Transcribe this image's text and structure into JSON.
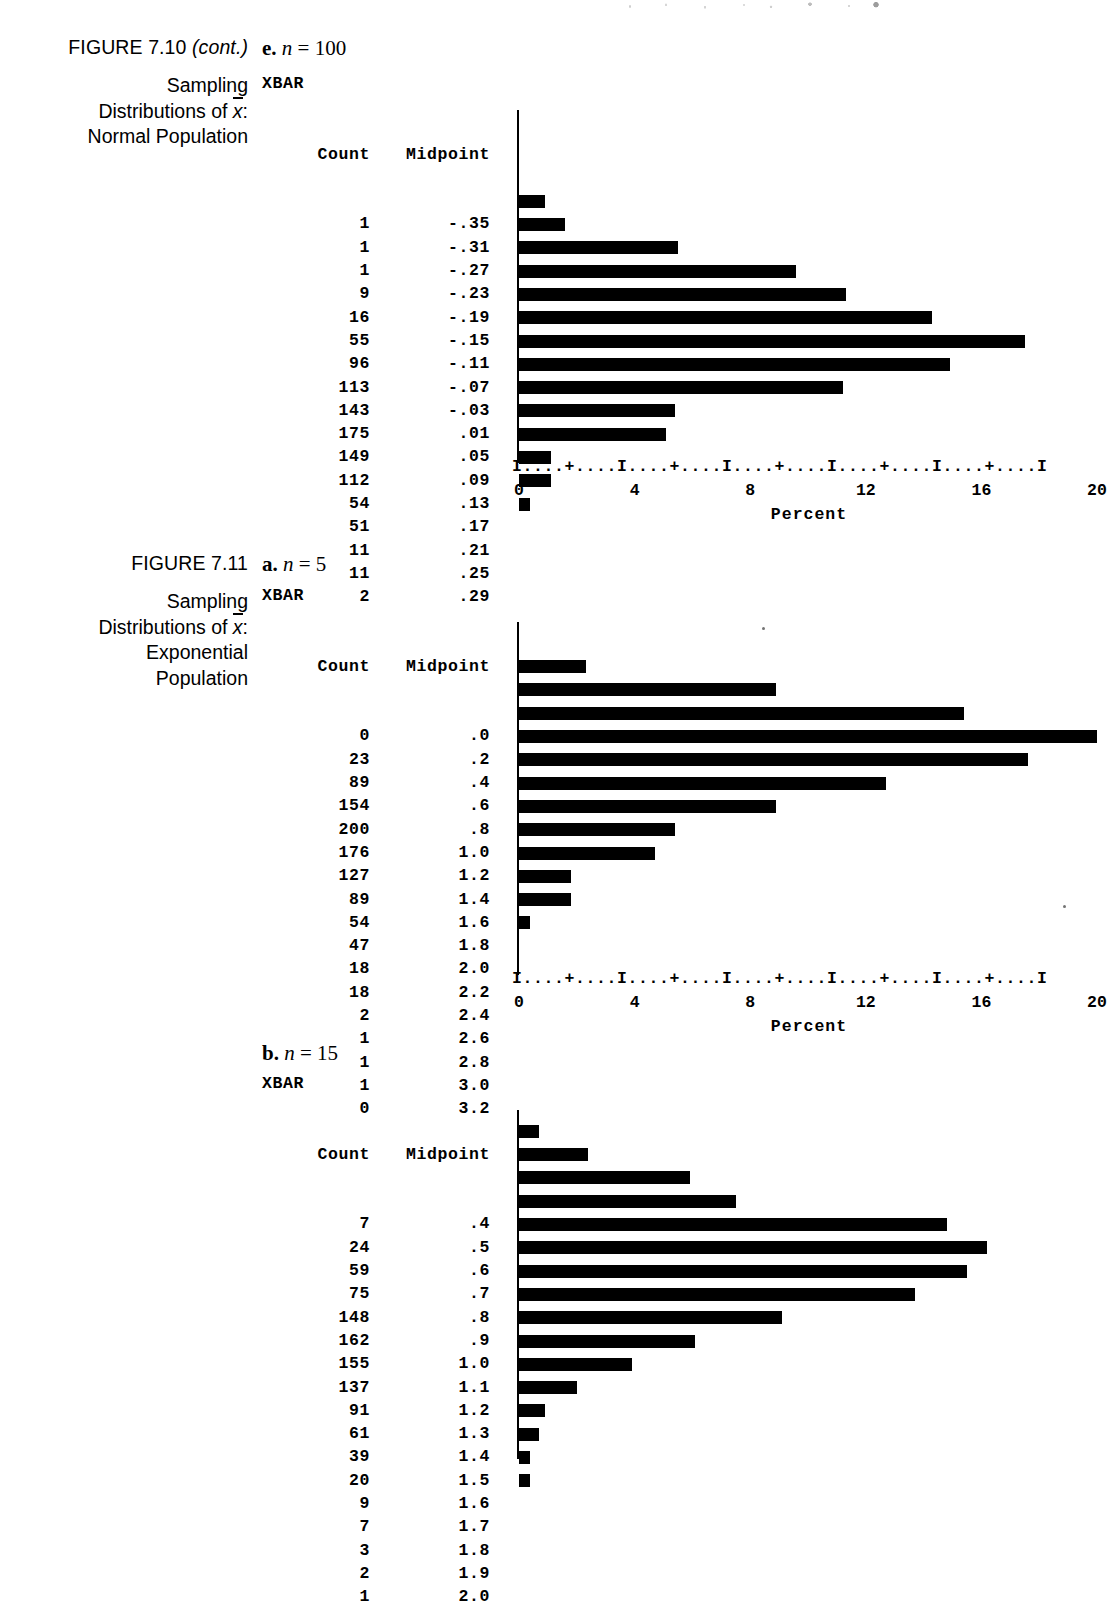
{
  "page": {
    "background": "#ffffff",
    "ink": "#000000"
  },
  "figures": [
    {
      "caption": {
        "title_main": "FIGURE 7.10",
        "title_note": "(cont.)",
        "sub_line1": "Sampling",
        "sub_line2_pre": "Distributions of ",
        "sub_line2_var": "x",
        "sub_line2_post": ":",
        "sub_line3": "Normal Population"
      },
      "part": {
        "letter": "e.",
        "var": "n",
        "eq": "=",
        "value": "100"
      },
      "printout_label": "XBAR",
      "columns": {
        "count": "Count",
        "midpoint": "Midpoint"
      },
      "axis_ruler": "I....+....I....+....I....+....I....+....I....+....I",
      "axis_ticks": [
        "0",
        "4",
        "8",
        "12",
        "16",
        "20"
      ],
      "axis_title": "Percent",
      "chart_data": {
        "type": "bar",
        "orientation": "horizontal",
        "title": "Sampling Distributions of x-bar: Normal Population, n = 100",
        "xlabel": "Percent",
        "ylabel": "Midpoint",
        "xlim": [
          0,
          20
        ],
        "grid": false,
        "legend": "none",
        "total_count": 1000,
        "categories": [
          "-.35",
          "-.31",
          "-.27",
          "-.23",
          "-.19",
          "-.15",
          "-.11",
          "-.07",
          "-.03",
          ".01",
          ".05",
          ".09",
          ".13",
          ".17",
          ".21",
          ".25",
          ".29"
        ],
        "counts": [
          1,
          1,
          1,
          9,
          16,
          55,
          96,
          113,
          143,
          175,
          149,
          112,
          54,
          51,
          11,
          11,
          2
        ],
        "values": [
          0.1,
          0.1,
          0.1,
          0.9,
          1.6,
          5.5,
          9.6,
          11.3,
          14.3,
          17.5,
          14.9,
          11.2,
          5.4,
          5.1,
          1.1,
          1.1,
          0.2
        ]
      }
    },
    {
      "caption": {
        "title_main": "FIGURE 7.11",
        "title_note": "",
        "sub_line1": "Sampling",
        "sub_line2_pre": "Distributions of ",
        "sub_line2_var": "x",
        "sub_line2_post": ":",
        "sub_line3": "Exponential",
        "sub_line4": "Population"
      },
      "part": {
        "letter": "a.",
        "var": "n",
        "eq": "=",
        "value": "5"
      },
      "printout_label": "XBAR",
      "columns": {
        "count": "Count",
        "midpoint": "Midpoint"
      },
      "axis_ruler": "I....+....I....+....I....+....I....+....I....+....I",
      "axis_ticks": [
        "0",
        "4",
        "8",
        "12",
        "16",
        "20"
      ],
      "axis_title": "Percent",
      "chart_data": {
        "type": "bar",
        "orientation": "horizontal",
        "title": "Sampling Distributions of x-bar: Exponential Population, n = 5",
        "xlabel": "Percent",
        "ylabel": "Midpoint",
        "xlim": [
          0,
          20
        ],
        "grid": false,
        "legend": "none",
        "total_count": 1000,
        "categories": [
          ".0",
          ".2",
          ".4",
          ".6",
          ".8",
          "1.0",
          "1.2",
          "1.4",
          "1.6",
          "1.8",
          "2.0",
          "2.2",
          "2.4",
          "2.6",
          "2.8",
          "3.0",
          "3.2"
        ],
        "counts": [
          0,
          23,
          89,
          154,
          200,
          176,
          127,
          89,
          54,
          47,
          18,
          18,
          2,
          1,
          1,
          1,
          0
        ],
        "values": [
          0.0,
          2.3,
          8.9,
          15.4,
          20.0,
          17.6,
          12.7,
          8.9,
          5.4,
          4.7,
          1.8,
          1.8,
          0.2,
          0.1,
          0.1,
          0.1,
          0.0
        ]
      }
    },
    {
      "caption": null,
      "part": {
        "letter": "b.",
        "var": "n",
        "eq": "=",
        "value": "15"
      },
      "printout_label": "XBAR",
      "columns": {
        "count": "Count",
        "midpoint": "Midpoint"
      },
      "axis_ruler": "",
      "axis_ticks": [],
      "axis_title": "",
      "chart_data": {
        "type": "bar",
        "orientation": "horizontal",
        "title": "Sampling Distributions of x-bar: Exponential Population, n = 15",
        "xlabel": "Percent",
        "ylabel": "Midpoint",
        "xlim": [
          0,
          20
        ],
        "grid": false,
        "legend": "none",
        "total_count": 1000,
        "categories": [
          ".4",
          ".5",
          ".6",
          ".7",
          ".8",
          ".9",
          "1.0",
          "1.1",
          "1.2",
          "1.3",
          "1.4",
          "1.5",
          "1.6",
          "1.7",
          "1.8",
          "1.9",
          "2.0"
        ],
        "counts": [
          7,
          24,
          59,
          75,
          148,
          162,
          155,
          137,
          91,
          61,
          39,
          20,
          9,
          7,
          3,
          2,
          1
        ],
        "values": [
          0.7,
          2.4,
          5.9,
          7.5,
          14.8,
          16.2,
          15.5,
          13.7,
          9.1,
          6.1,
          3.9,
          2.0,
          0.9,
          0.7,
          0.3,
          0.2,
          0.1
        ]
      }
    }
  ]
}
